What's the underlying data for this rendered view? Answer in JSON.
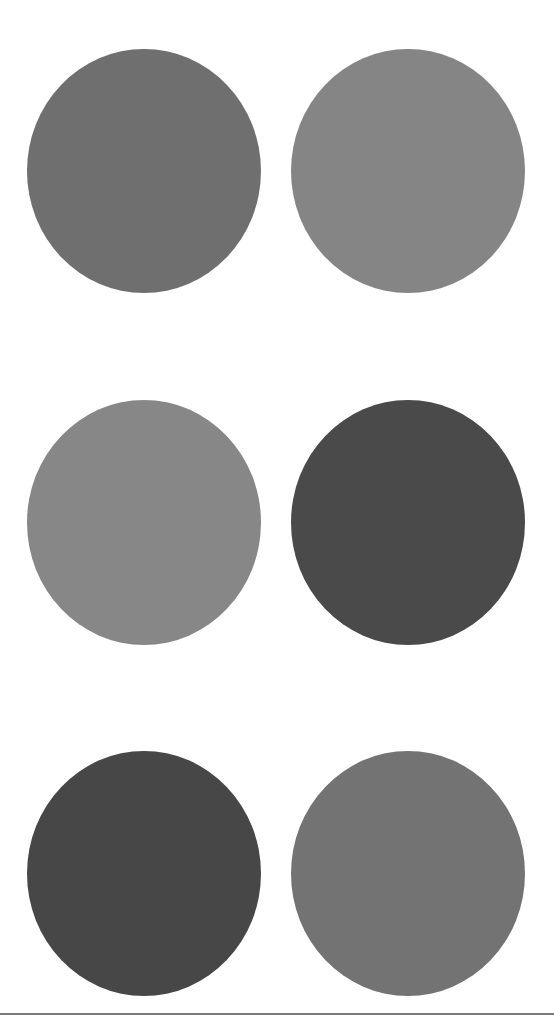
{
  "canvas": {
    "width": 554,
    "height": 1025,
    "background": "#ffffff"
  },
  "circles": [
    {
      "row": 1,
      "col": 1,
      "color": "#6f6f6f",
      "x": 27,
      "y": 49,
      "w": 234,
      "h": 244
    },
    {
      "row": 1,
      "col": 2,
      "color": "#858585",
      "x": 291,
      "y": 49,
      "w": 234,
      "h": 244
    },
    {
      "row": 2,
      "col": 1,
      "color": "#878787",
      "x": 27,
      "y": 400,
      "w": 234,
      "h": 245
    },
    {
      "row": 2,
      "col": 2,
      "color": "#4a4a4a",
      "x": 291,
      "y": 400,
      "w": 234,
      "h": 245
    },
    {
      "row": 3,
      "col": 1,
      "color": "#474747",
      "x": 27,
      "y": 751,
      "w": 234,
      "h": 245
    },
    {
      "row": 3,
      "col": 2,
      "color": "#737373",
      "x": 291,
      "y": 751,
      "w": 234,
      "h": 245
    }
  ],
  "divider": {
    "y": 1013,
    "color": "#7a7a7a"
  }
}
